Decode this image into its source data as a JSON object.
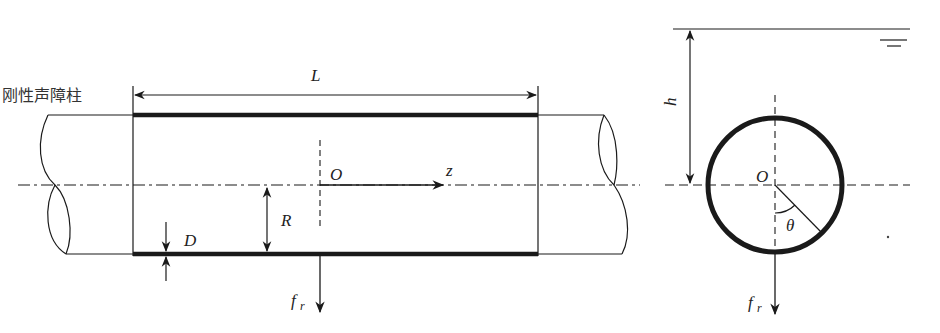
{
  "diagram": {
    "type": "cross-section schematic of rigid acoustic barrier cylinder",
    "left_view": {
      "caption": "刚性声障柱",
      "length_label": "L",
      "origin_label": "O",
      "axis_label": "z",
      "radius_label": "R",
      "thickness_label": "D",
      "force_label": "f",
      "force_subscript": "r"
    },
    "right_view": {
      "depth_label": "h",
      "origin_label": "O",
      "angle_label": "θ",
      "force_label": "f",
      "force_subscript": "r",
      "water_surface_symbol": "water-surface-icon"
    },
    "colors": {
      "stroke": "#1a1a1a",
      "background": "#ffffff"
    }
  }
}
